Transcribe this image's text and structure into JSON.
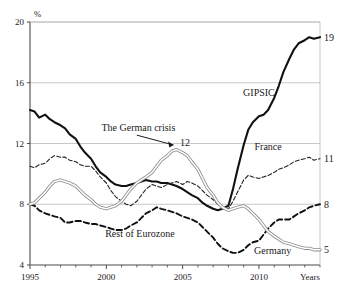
{
  "chart_data": {
    "type": "line",
    "title": "",
    "xlabel": "Years",
    "ylabel": "%",
    "xlim": [
      1995,
      2014
    ],
    "ylim": [
      4,
      20
    ],
    "yticks": [
      4,
      8,
      12,
      16,
      20
    ],
    "xticks": [
      1995,
      2000,
      2005,
      2010
    ],
    "xtick_labels": [
      "1995",
      "2000",
      "2005",
      "2010"
    ],
    "ytick_labels": [
      "4",
      "8",
      "12",
      "16",
      "20"
    ],
    "grid": "horizontal",
    "legend_position": "inline-labels",
    "annotations": [
      {
        "text": "The German crisis",
        "points_to_series": "Germany",
        "points_to_value": 12,
        "points_to_year": 2004.7
      },
      {
        "text": "12",
        "year": 2004.7,
        "value": 12
      }
    ],
    "series": [
      {
        "name": "GIPSIC",
        "style": "solid-thick-black",
        "color": "#111111",
        "end_label": "19",
        "label_x": 2010.0,
        "label_y": 15.1,
        "x": [
          1995.0,
          1995.3,
          1995.6,
          1996.0,
          1996.3,
          1996.6,
          1997.0,
          1997.3,
          1997.6,
          1998.0,
          1998.3,
          1998.6,
          1999.0,
          1999.3,
          1999.6,
          2000.0,
          2000.3,
          2000.6,
          2001.0,
          2001.3,
          2001.6,
          2002.0,
          2002.3,
          2002.6,
          2003.0,
          2003.3,
          2003.6,
          2004.0,
          2004.3,
          2004.6,
          2005.0,
          2005.3,
          2005.6,
          2006.0,
          2006.3,
          2006.6,
          2007.0,
          2007.3,
          2007.6,
          2008.0,
          2008.3,
          2008.6,
          2009.0,
          2009.3,
          2009.6,
          2010.0,
          2010.3,
          2010.6,
          2011.0,
          2011.3,
          2011.6,
          2012.0,
          2012.3,
          2012.6,
          2013.0,
          2013.3,
          2013.6,
          2014.0
        ],
        "y": [
          14.2,
          14.1,
          13.7,
          13.9,
          13.6,
          13.4,
          13.2,
          13.0,
          12.6,
          12.3,
          11.8,
          11.4,
          11.0,
          10.5,
          10.1,
          9.8,
          9.5,
          9.3,
          9.2,
          9.2,
          9.3,
          9.4,
          9.5,
          9.6,
          9.5,
          9.5,
          9.4,
          9.4,
          9.3,
          9.2,
          9.0,
          8.8,
          8.6,
          8.4,
          8.1,
          7.9,
          7.7,
          7.6,
          7.7,
          7.9,
          9.0,
          10.3,
          11.9,
          12.9,
          13.4,
          13.8,
          13.9,
          14.2,
          15.0,
          15.8,
          16.7,
          17.6,
          18.2,
          18.6,
          18.8,
          19.0,
          18.9,
          19.0
        ]
      },
      {
        "name": "France",
        "style": "dashed-thin-black",
        "color": "#222222",
        "end_label": "11",
        "label_x": 2010.6,
        "label_y": 11.6,
        "x": [
          1995.0,
          1995.3,
          1995.6,
          1996.0,
          1996.3,
          1996.6,
          1997.0,
          1997.3,
          1997.6,
          1998.0,
          1998.3,
          1998.6,
          1999.0,
          1999.3,
          1999.6,
          2000.0,
          2000.3,
          2000.6,
          2001.0,
          2001.3,
          2001.6,
          2002.0,
          2002.3,
          2002.6,
          2003.0,
          2003.3,
          2003.6,
          2004.0,
          2004.3,
          2004.6,
          2005.0,
          2005.3,
          2005.6,
          2006.0,
          2006.3,
          2006.6,
          2007.0,
          2007.3,
          2007.6,
          2008.0,
          2008.3,
          2008.6,
          2009.0,
          2009.3,
          2009.6,
          2010.0,
          2010.3,
          2010.6,
          2011.0,
          2011.3,
          2011.6,
          2012.0,
          2012.3,
          2012.6,
          2013.0,
          2013.3,
          2013.6,
          2014.0
        ],
        "y": [
          10.5,
          10.4,
          10.6,
          10.7,
          11.0,
          11.2,
          11.1,
          11.1,
          10.9,
          10.8,
          10.6,
          10.5,
          10.5,
          10.2,
          9.8,
          9.4,
          8.9,
          8.5,
          8.2,
          8.0,
          7.9,
          8.2,
          8.6,
          9.0,
          9.3,
          9.2,
          9.1,
          9.3,
          9.4,
          9.5,
          9.3,
          9.5,
          9.4,
          9.2,
          8.9,
          8.6,
          8.3,
          8.0,
          7.8,
          7.7,
          8.2,
          8.8,
          9.6,
          9.9,
          9.8,
          9.7,
          9.8,
          9.9,
          10.1,
          10.3,
          10.4,
          10.6,
          10.8,
          10.9,
          11.0,
          11.1,
          10.9,
          11.0
        ]
      },
      {
        "name": "Rest of Eurozone",
        "style": "dashed-thick-black",
        "color": "#111111",
        "end_label": "8",
        "label_x": 2002.2,
        "label_y": 5.85,
        "x": [
          1995.0,
          1995.3,
          1995.6,
          1996.0,
          1996.3,
          1996.6,
          1997.0,
          1997.3,
          1997.6,
          1998.0,
          1998.3,
          1998.6,
          1999.0,
          1999.3,
          1999.6,
          2000.0,
          2000.3,
          2000.6,
          2001.0,
          2001.3,
          2001.6,
          2002.0,
          2002.3,
          2002.6,
          2003.0,
          2003.3,
          2003.6,
          2004.0,
          2004.3,
          2004.6,
          2005.0,
          2005.3,
          2005.6,
          2006.0,
          2006.3,
          2006.6,
          2007.0,
          2007.3,
          2007.6,
          2008.0,
          2008.3,
          2008.6,
          2009.0,
          2009.3,
          2009.6,
          2010.0,
          2010.3,
          2010.6,
          2011.0,
          2011.3,
          2011.6,
          2012.0,
          2012.3,
          2012.6,
          2013.0,
          2013.3,
          2013.6,
          2014.0
        ],
        "y": [
          8.0,
          7.9,
          7.6,
          7.4,
          7.3,
          7.2,
          7.1,
          6.8,
          6.8,
          6.9,
          6.9,
          6.8,
          6.7,
          6.7,
          6.6,
          6.5,
          6.4,
          6.3,
          6.3,
          6.4,
          6.6,
          6.8,
          7.1,
          7.4,
          7.6,
          7.8,
          7.7,
          7.6,
          7.5,
          7.4,
          7.2,
          7.1,
          7.0,
          6.8,
          6.5,
          6.2,
          5.8,
          5.4,
          5.1,
          4.9,
          4.8,
          4.8,
          5.0,
          5.3,
          5.5,
          5.6,
          6.0,
          6.4,
          6.8,
          7.0,
          7.0,
          7.0,
          7.2,
          7.4,
          7.6,
          7.8,
          7.9,
          8.0
        ]
      },
      {
        "name": "Germany",
        "style": "double-outline-grey",
        "color": "#8c8c8c",
        "end_label": "5",
        "label_x": 2010.9,
        "label_y": 4.7,
        "x": [
          1995.0,
          1995.3,
          1995.6,
          1996.0,
          1996.3,
          1996.6,
          1997.0,
          1997.3,
          1997.6,
          1998.0,
          1998.3,
          1998.6,
          1999.0,
          1999.3,
          1999.6,
          2000.0,
          2000.3,
          2000.6,
          2001.0,
          2001.3,
          2001.6,
          2002.0,
          2002.3,
          2002.6,
          2003.0,
          2003.3,
          2003.6,
          2004.0,
          2004.3,
          2004.6,
          2005.0,
          2005.3,
          2005.6,
          2006.0,
          2006.3,
          2006.6,
          2007.0,
          2007.3,
          2007.6,
          2008.0,
          2008.3,
          2008.6,
          2009.0,
          2009.3,
          2009.6,
          2010.0,
          2010.3,
          2010.6,
          2011.0,
          2011.3,
          2011.6,
          2012.0,
          2012.3,
          2012.6,
          2013.0,
          2013.3,
          2013.6,
          2014.0
        ],
        "y": [
          8.0,
          8.1,
          8.4,
          8.8,
          9.2,
          9.5,
          9.6,
          9.5,
          9.4,
          9.2,
          8.9,
          8.6,
          8.3,
          8.0,
          7.8,
          7.7,
          7.8,
          7.9,
          8.2,
          8.6,
          9.0,
          9.4,
          9.6,
          9.8,
          10.1,
          10.5,
          10.9,
          11.2,
          11.5,
          11.6,
          11.4,
          11.2,
          10.8,
          10.3,
          9.7,
          9.1,
          8.6,
          8.1,
          7.8,
          7.6,
          7.7,
          7.8,
          7.9,
          7.7,
          7.4,
          7.0,
          6.6,
          6.2,
          5.9,
          5.7,
          5.5,
          5.4,
          5.3,
          5.2,
          5.1,
          5.1,
          5.0,
          5.0
        ]
      }
    ]
  },
  "axis": {
    "y_unit": "%",
    "x_title": "Years"
  },
  "colors": {
    "grid": "#b9b9b9",
    "axis": "#4a4a4a",
    "text": "#1a1a1a",
    "gipsic": "#111111",
    "france": "#222222",
    "rest_of_eurozone": "#111111",
    "germany": "#8c8c8c"
  }
}
